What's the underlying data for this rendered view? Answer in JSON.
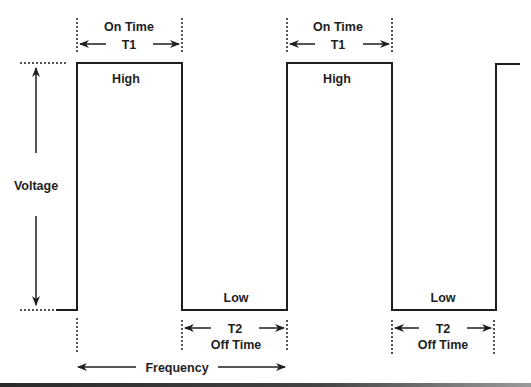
{
  "diagram": {
    "labels": {
      "on_time": "On Time",
      "t1": "T1",
      "t2": "T2",
      "off_time": "Off Time",
      "high": "High",
      "low": "Low",
      "voltage": "Voltage",
      "frequency": "Frequency"
    },
    "colors": {
      "line": "#1e1e1e",
      "background": "#ffffff"
    }
  }
}
